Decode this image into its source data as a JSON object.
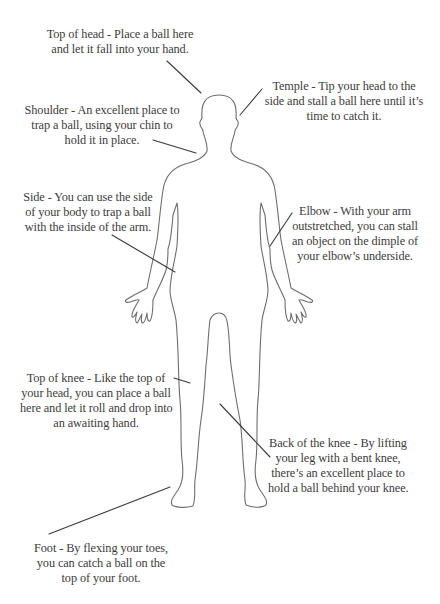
{
  "diagram": {
    "stroke_color": "#6e6e6e",
    "leader_color": "#3a3a3a",
    "text_color": "#3c3c3c",
    "callouts": [
      {
        "id": "top-of-head",
        "lines": [
          "Top of head - Place a ball here",
          "and let it fall into your hand."
        ]
      },
      {
        "id": "temple",
        "lines": [
          "Temple - Tip your head to the",
          "side and stall a ball here until it’s",
          "time to catch it."
        ]
      },
      {
        "id": "shoulder",
        "lines": [
          "Shoulder - An excellent place to",
          "trap a ball, using your chin to",
          "hold it in place."
        ]
      },
      {
        "id": "side",
        "lines": [
          "Side - You can use the side",
          "of your body to trap a ball",
          "with the inside of the arm."
        ]
      },
      {
        "id": "elbow",
        "lines": [
          "Elbow - With your arm",
          "outstretched, you can stall",
          "an object on the dimple of",
          "your elbow’s underside."
        ]
      },
      {
        "id": "top-of-knee",
        "lines": [
          "Top of knee - Like the top of",
          "your head, you can place a ball",
          "here and let it roll and drop into",
          "an awaiting hand."
        ]
      },
      {
        "id": "back-of-knee",
        "lines": [
          "Back of the knee - By lifting",
          "your leg with a bent knee,",
          "there’s an excellent place to",
          "hold a ball behind your knee."
        ]
      },
      {
        "id": "foot",
        "lines": [
          "Foot - By flexing your toes,",
          "you can catch a ball on the",
          "top of your foot."
        ]
      }
    ]
  }
}
